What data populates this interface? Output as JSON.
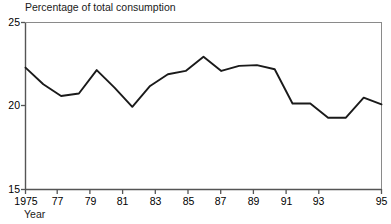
{
  "chart_data": {
    "type": "line",
    "title": "Percentage of total consumption",
    "xlabel": "Year",
    "ylabel": "",
    "xlim": [
      1975,
      1995
    ],
    "ylim": [
      15,
      25
    ],
    "grid": false,
    "legend": null,
    "line_color": "#1a1a1a",
    "x": [
      1975,
      1976,
      1977,
      1978,
      1979,
      1980,
      1981,
      1982,
      1983,
      1984,
      1985,
      1986,
      1987,
      1988,
      1989,
      1990,
      1991,
      1992,
      1993,
      1994,
      1995
    ],
    "values": [
      22.3,
      21.3,
      20.6,
      20.75,
      22.15,
      21.1,
      19.95,
      21.2,
      21.9,
      22.1,
      22.95,
      22.1,
      22.4,
      22.45,
      22.2,
      20.15,
      20.15,
      19.3,
      19.3,
      20.5,
      20.1
    ],
    "yticks": [
      15,
      20,
      25
    ],
    "ytick_labels": [
      "15",
      "20",
      "25"
    ],
    "xticks": [
      1975,
      1977,
      1979,
      1981,
      1983,
      1985,
      1987,
      1989,
      1991,
      1993,
      1995
    ],
    "xtick_labels": [
      "1975",
      "77",
      "79",
      "81",
      "83",
      "85",
      "87",
      "89",
      "91",
      "93",
      "95"
    ]
  }
}
